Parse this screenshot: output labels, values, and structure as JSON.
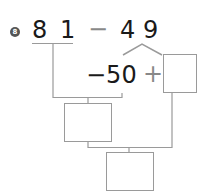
{
  "problem": {
    "number": "8",
    "expression": {
      "minuend_tens": "8",
      "minuend_ones": "1",
      "operator": "−",
      "subtrahend_tens": "4",
      "subtrahend_ones": "9"
    },
    "decomposition": {
      "part1": "−50",
      "plus": "+",
      "part2_box": ""
    },
    "boxes": {
      "intermediate": "",
      "result": ""
    }
  },
  "colors": {
    "text": "#1a1a1a",
    "lines": "#9a9a9a",
    "badge": "#555555"
  }
}
